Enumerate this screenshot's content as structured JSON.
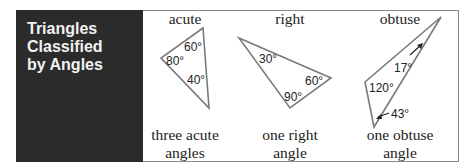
{
  "panel": {
    "title_lines": [
      "Triangles",
      "Classified",
      "by Angles"
    ],
    "background": "#2b2b2b",
    "text_color": "#f2f2f2"
  },
  "columns": [
    {
      "heading": "acute",
      "caption_lines": [
        "three acute",
        "angles"
      ],
      "angles": [
        "60°",
        "80°",
        "40°"
      ]
    },
    {
      "heading": "right",
      "caption_lines": [
        "one right",
        "angle"
      ],
      "angles": [
        "30°",
        "60°",
        "90°"
      ]
    },
    {
      "heading": "obtuse",
      "caption_lines": [
        "one obtuse",
        "angle"
      ],
      "angles": [
        "17°",
        "120°",
        "43°"
      ]
    }
  ],
  "colors": {
    "triangle_stroke": "#7a7a7a",
    "frame_border": "#8a8a8a"
  }
}
